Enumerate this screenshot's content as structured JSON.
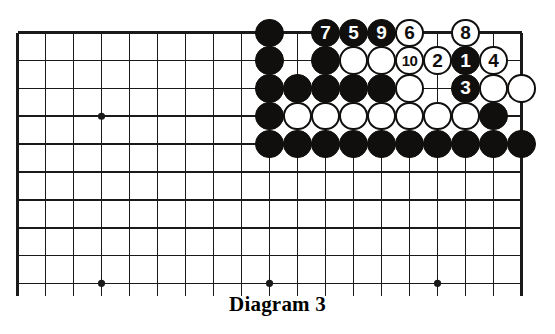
{
  "figure": {
    "caption": "Diagram 3",
    "kind": "go-board-diagram"
  },
  "board": {
    "columns": 19,
    "visible_rows": 10,
    "origin_x": 17.5,
    "origin_y": 32.7,
    "col_spacing": 28.0,
    "row_spacing": 27.85,
    "line_color": "#1a1a1a",
    "background_color": "#ffffff",
    "stone_radius": 14.2,
    "edges": {
      "top": true,
      "left": true,
      "right": true,
      "bottom": false
    },
    "star_points": [
      {
        "col": 3,
        "row": 3
      },
      {
        "col": 3,
        "row": 9
      },
      {
        "col": 9,
        "row": 9
      },
      {
        "col": 15,
        "row": 9
      }
    ]
  },
  "colors": {
    "black_stone": "#100f0d",
    "white_stone": "#ffffff",
    "stone_outline": "#100f0d",
    "black_label": "#ffffff",
    "white_label": "#100f0d"
  },
  "stones": [
    {
      "col": 9,
      "row": 0,
      "color": "black",
      "label": ""
    },
    {
      "col": 11,
      "row": 0,
      "color": "black",
      "label": "7"
    },
    {
      "col": 12,
      "row": 0,
      "color": "black",
      "label": "5"
    },
    {
      "col": 13,
      "row": 0,
      "color": "black",
      "label": "9"
    },
    {
      "col": 14,
      "row": 0,
      "color": "white",
      "label": "6"
    },
    {
      "col": 16,
      "row": 0,
      "color": "white",
      "label": "8"
    },
    {
      "col": 9,
      "row": 1,
      "color": "black",
      "label": ""
    },
    {
      "col": 11,
      "row": 1,
      "color": "black",
      "label": ""
    },
    {
      "col": 12,
      "row": 1,
      "color": "white",
      "label": ""
    },
    {
      "col": 13,
      "row": 1,
      "color": "white",
      "label": ""
    },
    {
      "col": 14,
      "row": 1,
      "color": "white",
      "label": "10"
    },
    {
      "col": 15,
      "row": 1,
      "color": "white",
      "label": "2"
    },
    {
      "col": 16,
      "row": 1,
      "color": "black",
      "label": "1"
    },
    {
      "col": 17,
      "row": 1,
      "color": "white",
      "label": "4"
    },
    {
      "col": 9,
      "row": 2,
      "color": "black",
      "label": ""
    },
    {
      "col": 10,
      "row": 2,
      "color": "black",
      "label": ""
    },
    {
      "col": 11,
      "row": 2,
      "color": "black",
      "label": ""
    },
    {
      "col": 12,
      "row": 2,
      "color": "black",
      "label": ""
    },
    {
      "col": 13,
      "row": 2,
      "color": "black",
      "label": ""
    },
    {
      "col": 14,
      "row": 2,
      "color": "white",
      "label": ""
    },
    {
      "col": 16,
      "row": 2,
      "color": "black",
      "label": "3"
    },
    {
      "col": 17,
      "row": 2,
      "color": "white",
      "label": ""
    },
    {
      "col": 18,
      "row": 2,
      "color": "white",
      "label": ""
    },
    {
      "col": 9,
      "row": 3,
      "color": "black",
      "label": ""
    },
    {
      "col": 10,
      "row": 3,
      "color": "white",
      "label": ""
    },
    {
      "col": 11,
      "row": 3,
      "color": "white",
      "label": ""
    },
    {
      "col": 12,
      "row": 3,
      "color": "white",
      "label": ""
    },
    {
      "col": 13,
      "row": 3,
      "color": "white",
      "label": ""
    },
    {
      "col": 14,
      "row": 3,
      "color": "white",
      "label": ""
    },
    {
      "col": 15,
      "row": 3,
      "color": "white",
      "label": ""
    },
    {
      "col": 16,
      "row": 3,
      "color": "white",
      "label": ""
    },
    {
      "col": 17,
      "row": 3,
      "color": "black",
      "label": ""
    },
    {
      "col": 9,
      "row": 4,
      "color": "black",
      "label": ""
    },
    {
      "col": 10,
      "row": 4,
      "color": "black",
      "label": ""
    },
    {
      "col": 11,
      "row": 4,
      "color": "black",
      "label": ""
    },
    {
      "col": 12,
      "row": 4,
      "color": "black",
      "label": ""
    },
    {
      "col": 13,
      "row": 4,
      "color": "black",
      "label": ""
    },
    {
      "col": 14,
      "row": 4,
      "color": "black",
      "label": ""
    },
    {
      "col": 15,
      "row": 4,
      "color": "black",
      "label": ""
    },
    {
      "col": 16,
      "row": 4,
      "color": "black",
      "label": ""
    },
    {
      "col": 17,
      "row": 4,
      "color": "black",
      "label": ""
    },
    {
      "col": 18,
      "row": 4,
      "color": "black",
      "label": ""
    }
  ],
  "move_sequence": [
    {
      "move": "1",
      "color": "black",
      "col": 16,
      "row": 1
    },
    {
      "move": "2",
      "color": "white",
      "col": 15,
      "row": 1
    },
    {
      "move": "3",
      "color": "black",
      "col": 16,
      "row": 2
    },
    {
      "move": "4",
      "color": "white",
      "col": 17,
      "row": 1
    },
    {
      "move": "5",
      "color": "black",
      "col": 12,
      "row": 0
    },
    {
      "move": "6",
      "color": "white",
      "col": 14,
      "row": 0
    },
    {
      "move": "7",
      "color": "black",
      "col": 11,
      "row": 0
    },
    {
      "move": "8",
      "color": "white",
      "col": 16,
      "row": 0
    },
    {
      "move": "9",
      "color": "black",
      "col": 13,
      "row": 0
    },
    {
      "move": "10",
      "color": "white",
      "col": 14,
      "row": 1
    }
  ]
}
